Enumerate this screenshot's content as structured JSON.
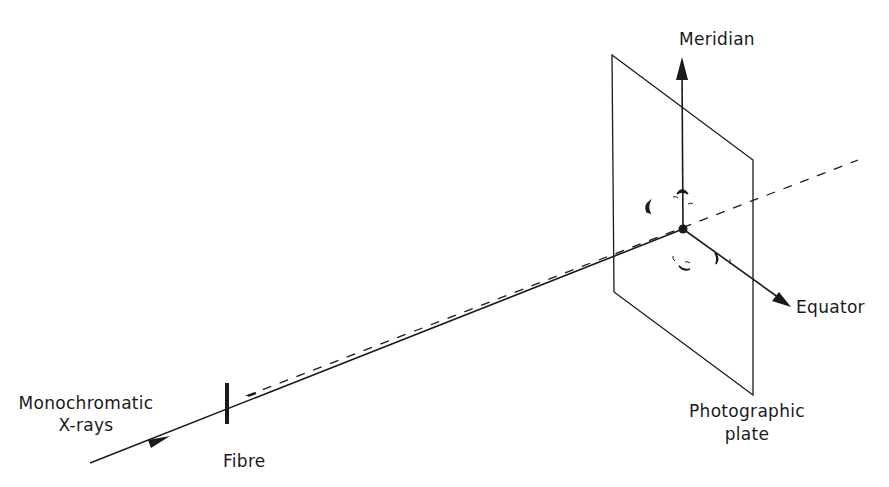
{
  "diagram": {
    "colors": {
      "ink": "#1a1a1a",
      "background": "#ffffff"
    },
    "labels": {
      "meridian": "Meridian",
      "equator": "Equator",
      "source_line1": "Monochromatic",
      "source_line2": "X-rays",
      "fibre": "Fibre",
      "plate_line1": "Photographic",
      "plate_line2": "plate"
    },
    "elements": [
      {
        "id": "incident-beam",
        "type": "solid-line-with-arrow"
      },
      {
        "id": "fibre",
        "type": "thick-vertical-bar"
      },
      {
        "id": "diffracted-beam",
        "type": "dashed-line"
      },
      {
        "id": "photographic-plate",
        "type": "parallelogram"
      },
      {
        "id": "meridian-axis",
        "type": "arrow-up"
      },
      {
        "id": "equator-axis",
        "type": "arrow-down-right"
      },
      {
        "id": "beam-center",
        "type": "filled-dot"
      },
      {
        "id": "diffraction-arcs",
        "type": "reflection-marks"
      }
    ]
  }
}
